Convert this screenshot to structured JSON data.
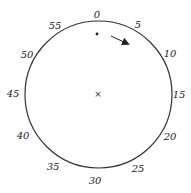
{
  "diagram": {
    "type": "clock-dial",
    "colors": {
      "stroke": "#333333",
      "text": "#222222",
      "background": "#ffffff"
    },
    "circle": {
      "cx": 98.5,
      "cy": 94.5,
      "r": 73.5
    },
    "center_marker": {
      "symbol": "×",
      "x": 98,
      "y": 94
    },
    "dot": {
      "x": 97,
      "y": 34
    },
    "arrow": {
      "x1": 111,
      "y1": 36,
      "x2": 128,
      "y2": 44,
      "direction": "clockwise"
    },
    "labels": [
      {
        "text": "0",
        "x": 97,
        "y": 18
      },
      {
        "text": "5",
        "x": 138,
        "y": 28
      },
      {
        "text": "10",
        "x": 170,
        "y": 57
      },
      {
        "text": "15",
        "x": 179,
        "y": 98
      },
      {
        "text": "20",
        "x": 170,
        "y": 140
      },
      {
        "text": "25",
        "x": 138,
        "y": 172
      },
      {
        "text": "30",
        "x": 95,
        "y": 184
      },
      {
        "text": "35",
        "x": 53,
        "y": 170
      },
      {
        "text": "40",
        "x": 23,
        "y": 139
      },
      {
        "text": "45",
        "x": 13,
        "y": 97
      },
      {
        "text": "50",
        "x": 27,
        "y": 58
      },
      {
        "text": "55",
        "x": 55,
        "y": 29
      }
    ]
  }
}
